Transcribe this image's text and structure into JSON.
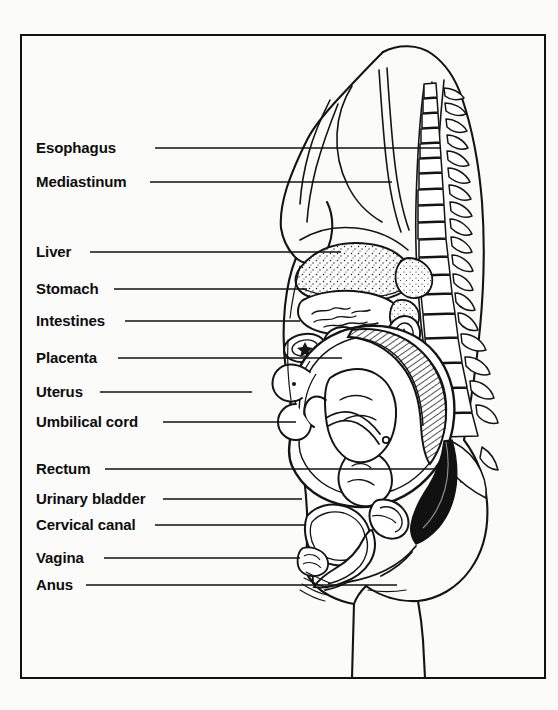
{
  "figure": {
    "type": "anatomical-line-drawing",
    "frame": {
      "x": 21,
      "y": 35,
      "width": 524,
      "height": 643,
      "stroke": "#111111",
      "stroke_width": 2
    },
    "colors": {
      "background": "#fbfbfa",
      "ink": "#111111",
      "paper": "#ffffff"
    },
    "labels": [
      {
        "id": "esophagus",
        "text": "Esophagus",
        "x": 36,
        "y": 152,
        "line_from": 155,
        "line_to": 441
      },
      {
        "id": "mediastinum",
        "text": "Mediastinum",
        "x": 36,
        "y": 186,
        "line_from": 150,
        "line_to": 392
      },
      {
        "id": "liver",
        "text": "Liver",
        "x": 36,
        "y": 256,
        "line_from": 90,
        "line_to": 341
      },
      {
        "id": "stomach",
        "text": "Stomach",
        "x": 36,
        "y": 293,
        "line_from": 114,
        "line_to": 307
      },
      {
        "id": "intestines",
        "text": "Intestines",
        "x": 36,
        "y": 325,
        "line_from": 125,
        "line_to": 300
      },
      {
        "id": "placenta",
        "text": "Placenta",
        "x": 36,
        "y": 362,
        "line_from": 118,
        "line_to": 342
      },
      {
        "id": "uterus",
        "text": "Uterus",
        "x": 36,
        "y": 396,
        "line_from": 100,
        "line_to": 252
      },
      {
        "id": "umbilical-cord",
        "text": "Umbilical cord",
        "x": 36,
        "y": 426,
        "line_from": 163,
        "line_to": 296
      },
      {
        "id": "rectum",
        "text": "Rectum",
        "x": 36,
        "y": 473,
        "line_from": 105,
        "line_to": 441
      },
      {
        "id": "urinary-bladder",
        "text": "Urinary bladder",
        "x": 36,
        "y": 503,
        "line_from": 163,
        "line_to": 302
      },
      {
        "id": "cervical-canal",
        "text": "Cervical canal",
        "x": 36,
        "y": 529,
        "line_from": 155,
        "line_to": 306
      },
      {
        "id": "vagina",
        "text": "Vagina",
        "x": 36,
        "y": 562,
        "line_from": 104,
        "line_to": 300
      },
      {
        "id": "anus",
        "text": "Anus",
        "x": 36,
        "y": 589,
        "line_from": 86,
        "line_to": 397
      }
    ],
    "structures": [
      "body-outline",
      "spine",
      "vertebrae",
      "breast",
      "diaphragm",
      "liver",
      "stomach",
      "intestines",
      "uterus",
      "placenta",
      "fetus",
      "umbilical-cord",
      "urinary-bladder",
      "rectum",
      "cervical-canal",
      "vagina",
      "anus",
      "pubic-bone",
      "sacrum",
      "coccyx"
    ]
  }
}
